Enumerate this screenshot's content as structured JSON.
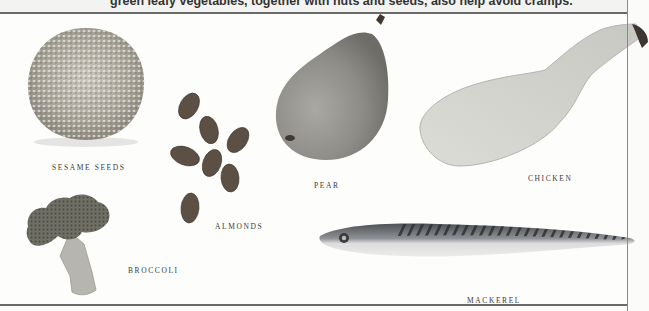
{
  "caption": {
    "text": "green leafy vegetables, together with nuts and seeds, also help avoid cramps."
  },
  "items": [
    {
      "id": "sesame-seeds",
      "label": "Sesame Seeds"
    },
    {
      "id": "almonds",
      "label": "Almonds"
    },
    {
      "id": "pear",
      "label": "Pear"
    },
    {
      "id": "chicken",
      "label": "Chicken"
    },
    {
      "id": "broccoli",
      "label": "Broccoli"
    },
    {
      "id": "mackerel",
      "label": "Mackerel"
    }
  ],
  "colors": {
    "background": "#fdfdfc",
    "rule": "#6a6a6a",
    "label": "#3a3a3a"
  }
}
